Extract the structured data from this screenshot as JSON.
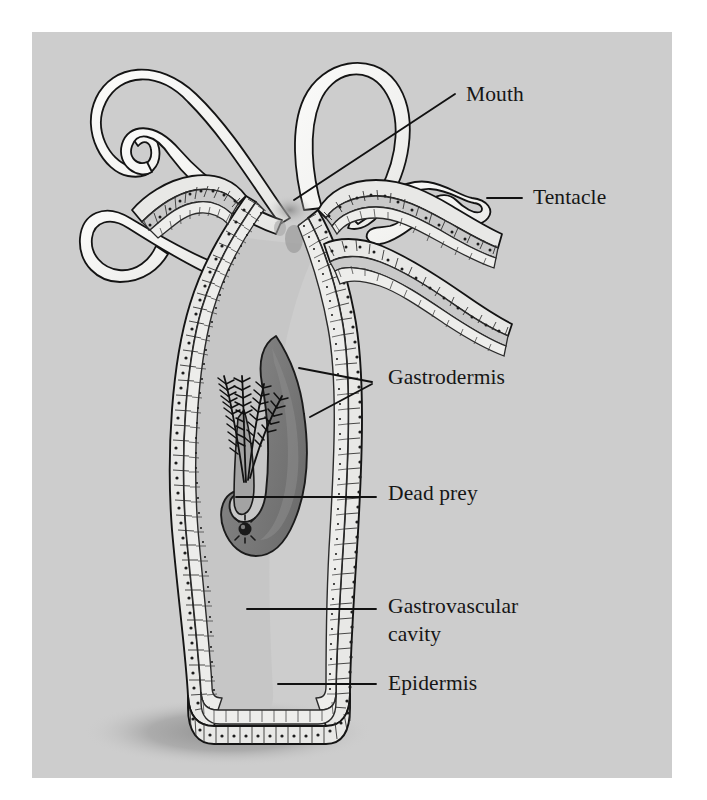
{
  "figure": {
    "panel_background": "#cdcdcd",
    "page_background": "#ffffff",
    "ink_color": "#141414",
    "tentacle_fill": "#f4f4f2",
    "epidermis_fill": "#e8e8e6",
    "gastrodermis_fill": "#ededeb",
    "cavity_fill": "#c6c6c6",
    "prey_fill": "#7e7e7e",
    "prey_fill_dark": "#6b6b6b",
    "mouth_shadow": "#9a9a9a",
    "ground_shadow": "#9c9c9c"
  },
  "labels": [
    {
      "id": "mouth",
      "text": "Mouth",
      "x": 466,
      "y": 101,
      "leader": "M294,200 L455,95"
    },
    {
      "id": "tentacle",
      "text": "Tentacle",
      "x": 533,
      "y": 204,
      "leader": "M487,198 L522,198"
    },
    {
      "id": "gastrodermis",
      "text": "Gastrodermis",
      "x": 388,
      "y": 384,
      "leader": "M299,368 L372,382 M310,417 L372,384"
    },
    {
      "id": "dead_prey",
      "text": "Dead prey",
      "x": 388,
      "y": 500,
      "leader": "M236,497 L376,497"
    },
    {
      "id": "gastrovascular",
      "text": "Gastrovascular",
      "x": 388,
      "y": 613,
      "leader": "M247,609 L376,609"
    },
    {
      "id": "cavity",
      "text": "cavity",
      "x": 388,
      "y": 641,
      "leader": ""
    },
    {
      "id": "epidermis",
      "text": "Epidermis",
      "x": 388,
      "y": 690,
      "leader": "M278,684 L376,684"
    }
  ],
  "structures": [
    {
      "id": "tentacle-1",
      "name": "tentacle-upper-left"
    },
    {
      "id": "tentacle-2",
      "name": "tentacle-upper-right"
    },
    {
      "id": "tentacle-3",
      "name": "tentacle-mid-left"
    },
    {
      "id": "tentacle-4",
      "name": "tentacle-lower-left"
    },
    {
      "id": "tentacle-5",
      "name": "tentacle-right-cutaway"
    },
    {
      "id": "tentacle-6",
      "name": "tentacle-right-lower"
    },
    {
      "id": "mouth",
      "name": "mouth-opening"
    },
    {
      "id": "body-column",
      "name": "body-column"
    },
    {
      "id": "basal-disc",
      "name": "basal-disc-foot"
    },
    {
      "id": "prey",
      "name": "dead-prey-crustacean"
    },
    {
      "id": "prey-eye",
      "name": "prey-eye-spot"
    },
    {
      "id": "antennae",
      "name": "prey-feathery-antennae"
    },
    {
      "id": "shadow",
      "name": "ground-shadow"
    }
  ]
}
